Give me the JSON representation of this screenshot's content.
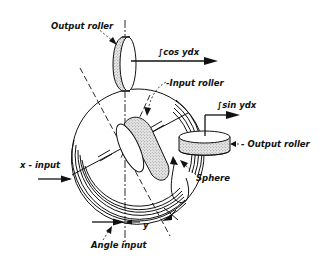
{
  "figure": {
    "labels": {
      "output_roller_top": "Output roller",
      "cos_output": "∫cos ydx",
      "input_roller": "-Input roller",
      "sin_output": "∫sin ydx",
      "output_roller_right": "- Output roller",
      "x_input": "x - input",
      "sphere": "Sphere",
      "y_symbol": "y",
      "angle_input": "Angle input"
    }
  }
}
